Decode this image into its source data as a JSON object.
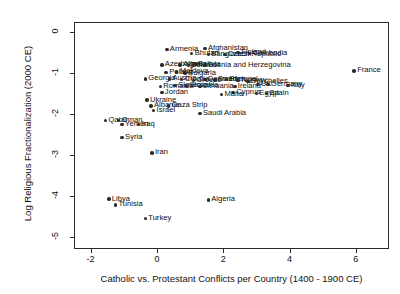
{
  "chart_data": {
    "type": "scatter",
    "title": "",
    "xlabel": "Catholic vs. Protestant Conflicts per Country (1400 - 1900 CE)",
    "ylabel": "Log Religious Fractionalization (2000 CE)",
    "xlim": [
      -2.5,
      7.0
    ],
    "ylim": [
      -5.3,
      0.25
    ],
    "xticks": [
      -2,
      0,
      2,
      4,
      6
    ],
    "xticklabels": [
      "-2",
      "0",
      "2",
      "4",
      "6"
    ],
    "yticks": [
      0,
      -1,
      -2,
      -3,
      -4,
      -5
    ],
    "yticklabels": [
      "0",
      "-1",
      "-2",
      "-3",
      "-4",
      "-5"
    ],
    "grid": false,
    "legend": null,
    "marker": "filled-circle",
    "marker_color": "#2a2a2a",
    "points": [
      {
        "label": "Armenia",
        "x": 0.3,
        "y": -0.42,
        "side": "r"
      },
      {
        "label": "Bhutan",
        "x": 1.05,
        "y": -0.52,
        "side": "r"
      },
      {
        "label": "Afghanistan",
        "x": 1.45,
        "y": -0.4,
        "side": "r"
      },
      {
        "label": "Bangladesh",
        "x": 1.55,
        "y": -0.55,
        "side": "r"
      },
      {
        "label": "Czech Republic",
        "x": 2.05,
        "y": -0.55,
        "side": "r"
      },
      {
        "label": "Finland",
        "x": 2.45,
        "y": -0.5,
        "side": "r"
      },
      {
        "label": "Cambodia",
        "x": 2.8,
        "y": -0.52,
        "side": "r"
      },
      {
        "label": "Azerbaijan",
        "x": 0.15,
        "y": -0.8,
        "side": "r"
      },
      {
        "label": "Algeria",
        "x": 0.7,
        "y": -0.8,
        "side": "r"
      },
      {
        "label": "Belarus",
        "x": 0.95,
        "y": -0.82,
        "side": "r"
      },
      {
        "label": "Bolivia",
        "x": 1.15,
        "y": -0.78,
        "side": "r"
      },
      {
        "label": "Bosnia and Herzegovina",
        "x": 1.45,
        "y": -0.82,
        "side": "r"
      },
      {
        "label": "Poland",
        "x": 0.28,
        "y": -0.98,
        "side": "r"
      },
      {
        "label": "Moldova",
        "x": 0.6,
        "y": -0.97,
        "side": "r"
      },
      {
        "label": "Bulgaria",
        "x": 0.85,
        "y": -1.0,
        "side": "r"
      },
      {
        "label": "Georgia",
        "x": -0.35,
        "y": -1.14,
        "side": "r"
      },
      {
        "label": "Austria",
        "x": 0.38,
        "y": -1.14,
        "side": "r"
      },
      {
        "label": "Croatia",
        "x": 0.75,
        "y": -1.16,
        "side": "r"
      },
      {
        "label": "Greece",
        "x": 1.1,
        "y": -1.18,
        "side": "r"
      },
      {
        "label": "Denmark",
        "x": 1.45,
        "y": -1.16,
        "side": "r"
      },
      {
        "label": "Sweden",
        "x": 1.75,
        "y": -1.17,
        "side": "r"
      },
      {
        "label": "Portugal",
        "x": 2.1,
        "y": -1.16,
        "side": "r"
      },
      {
        "label": "Norway",
        "x": 2.45,
        "y": -1.18,
        "side": "r"
      },
      {
        "label": "Seychelles",
        "x": 2.75,
        "y": -1.2,
        "side": "r"
      },
      {
        "label": "Romania",
        "x": 0.1,
        "y": -1.32,
        "side": "r"
      },
      {
        "label": "Slovenia",
        "x": 0.55,
        "y": -1.3,
        "side": "r"
      },
      {
        "label": "Slovakia",
        "x": 0.9,
        "y": -1.31,
        "side": "r"
      },
      {
        "label": "Lithuania",
        "x": 1.3,
        "y": -1.33,
        "side": "r"
      },
      {
        "label": "Ireland",
        "x": 2.35,
        "y": -1.32,
        "side": "r"
      },
      {
        "label": "UK",
        "x": 3.05,
        "y": -1.28,
        "side": "r"
      },
      {
        "label": "Germany",
        "x": 3.35,
        "y": -1.28,
        "side": "r"
      },
      {
        "label": "Italy",
        "x": 3.95,
        "y": -1.3,
        "side": "r"
      },
      {
        "label": "Jordan",
        "x": 0.15,
        "y": -1.47,
        "side": "r"
      },
      {
        "label": "Cyprus",
        "x": 2.3,
        "y": -1.47,
        "side": "r"
      },
      {
        "label": "Malta",
        "x": 1.95,
        "y": -1.52,
        "side": "r"
      },
      {
        "label": "Egypt",
        "x": 3.0,
        "y": -1.5,
        "side": "r"
      },
      {
        "label": "Spain",
        "x": 3.3,
        "y": -1.5,
        "side": "r"
      },
      {
        "label": "Ukraine",
        "x": -0.3,
        "y": -1.66,
        "side": "r"
      },
      {
        "label": "Albania",
        "x": -0.18,
        "y": -1.8,
        "side": "r"
      },
      {
        "label": "Gaza Strip",
        "x": 0.35,
        "y": -1.8,
        "side": "r"
      },
      {
        "label": "Israel",
        "x": -0.1,
        "y": -1.92,
        "side": "r"
      },
      {
        "label": "Saudi Arabia",
        "x": 1.3,
        "y": -1.98,
        "side": "r"
      },
      {
        "label": "Qatar",
        "x": -1.55,
        "y": -2.16,
        "side": "r"
      },
      {
        "label": "Oman",
        "x": -1.15,
        "y": -2.16,
        "side": "r"
      },
      {
        "label": "Yemen",
        "x": -1.05,
        "y": -2.26,
        "side": "r"
      },
      {
        "label": "Iraq",
        "x": -0.55,
        "y": -2.26,
        "side": "r"
      },
      {
        "label": "Syria",
        "x": -1.05,
        "y": -2.58,
        "side": "r"
      },
      {
        "label": "Iran",
        "x": -0.15,
        "y": -2.95,
        "side": "r"
      },
      {
        "label": "Libya",
        "x": -1.45,
        "y": -4.08,
        "side": "r"
      },
      {
        "label": "Tunisia",
        "x": -1.25,
        "y": -4.22,
        "side": "r"
      },
      {
        "label": "Algeria ",
        "x": 1.55,
        "y": -4.1,
        "side": "r"
      },
      {
        "label": "Turkey",
        "x": -0.35,
        "y": -4.55,
        "side": "r"
      },
      {
        "label": "France",
        "x": 5.95,
        "y": -0.95,
        "side": "r"
      }
    ]
  }
}
